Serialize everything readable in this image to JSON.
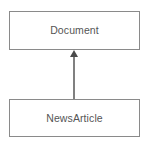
{
  "diagram": {
    "type": "uml-class-diagram",
    "width": 148,
    "height": 146,
    "background_color": "#ffffff",
    "border_color": "#8a8a8a",
    "text_color": "#555555",
    "connector_color": "#4a4a4a",
    "classes": [
      {
        "id": "document",
        "name": "Document",
        "x": 9,
        "y": 11,
        "width": 131,
        "height": 39
      },
      {
        "id": "newsarticle",
        "name": "NewsArticle",
        "x": 9,
        "y": 99,
        "width": 131,
        "height": 38
      }
    ],
    "relationships": [
      {
        "id": "newsarticle-extends-document",
        "kind": "generalization",
        "from": "newsarticle",
        "to": "document",
        "arrowhead": "solid-triangle",
        "line_x": 74,
        "line_from_y": 99,
        "line_to_y": 57,
        "arrow_tip_y": 50,
        "arrow_half_width": 4
      }
    ]
  }
}
